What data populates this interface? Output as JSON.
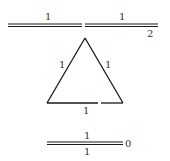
{
  "diagram": {
    "top_bond": {
      "type": "double",
      "labels_above": [
        "1",
        "1"
      ],
      "end_label": "2"
    },
    "triangle": {
      "type": "single",
      "edge_labels": {
        "left": "1",
        "right": "1",
        "bottom": "1"
      }
    },
    "bottom_bond": {
      "type": "double",
      "label_above": "1",
      "label_below": "1",
      "end_label": "0"
    }
  },
  "colors": {
    "stroke": "#1a1a1a",
    "label": "#333333",
    "background": "#ffffff"
  }
}
